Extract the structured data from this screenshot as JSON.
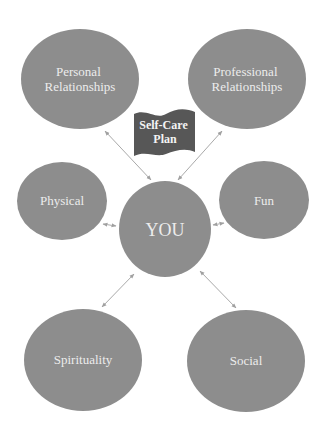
{
  "title_banner": {
    "lines": [
      "Self-Care",
      "Plan"
    ]
  },
  "colors": {
    "node_fill": "#8d8d8d",
    "node_text": "#ececec",
    "banner_fill": "#575757",
    "connector": "#a9a9a9",
    "background": "#ffffff"
  },
  "center_node": {
    "id": "you",
    "lines": [
      "YOU"
    ]
  },
  "nodes": [
    {
      "id": "personal-relationships",
      "lines": [
        "Personal",
        "Relationships"
      ]
    },
    {
      "id": "professional-relationships",
      "lines": [
        "Professional",
        "Relationships"
      ]
    },
    {
      "id": "physical",
      "lines": [
        "Physical"
      ]
    },
    {
      "id": "fun",
      "lines": [
        "Fun"
      ]
    },
    {
      "id": "spirituality",
      "lines": [
        "Spirituality"
      ]
    },
    {
      "id": "social",
      "lines": [
        "Social"
      ]
    }
  ],
  "connections": [
    {
      "from": "you",
      "to": "personal-relationships",
      "bidirectional": true
    },
    {
      "from": "you",
      "to": "professional-relationships",
      "bidirectional": true
    },
    {
      "from": "you",
      "to": "physical",
      "bidirectional": true
    },
    {
      "from": "you",
      "to": "fun",
      "bidirectional": true
    },
    {
      "from": "you",
      "to": "spirituality",
      "bidirectional": true
    },
    {
      "from": "you",
      "to": "social",
      "bidirectional": true
    }
  ]
}
